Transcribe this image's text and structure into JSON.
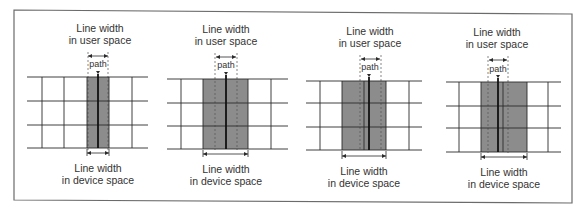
{
  "figure": {
    "border_color": "#6b6b6b",
    "grid_color": "#2a2a2a",
    "fill_color": "#8c8c8c",
    "panels": [
      {
        "id": "panel-1",
        "top_label_line1": "Line width",
        "top_label_line2": "in user space",
        "path_label": "path",
        "bottom_label_line1": "Line width",
        "bottom_label_line2": "in device space",
        "description": "Thin user-space stroke centered on a pixel boundary covers exactly one device pixel column on each side"
      },
      {
        "id": "panel-2",
        "top_label_line1": "Line width",
        "top_label_line2": "in user space",
        "path_label": "path",
        "bottom_label_line1": "Line width",
        "bottom_label_line2": "in device space",
        "description": "Stroke centered on pixel boundary widened to cover two full pixel columns"
      },
      {
        "id": "panel-3",
        "top_label_line1": "Line width",
        "top_label_line2": "in user space",
        "path_label": "path",
        "bottom_label_line1": "Line width",
        "bottom_label_line2": "in device space",
        "description": "Path slightly off pixel boundary; device width spans two pixel columns"
      },
      {
        "id": "panel-4",
        "top_label_line1": "Line width",
        "top_label_line2": "in user space",
        "path_label": "path",
        "bottom_label_line1": "Line width",
        "bottom_label_line2": "in device space",
        "description": "Path offset within pixel; device coverage spans two pixel columns"
      }
    ]
  }
}
